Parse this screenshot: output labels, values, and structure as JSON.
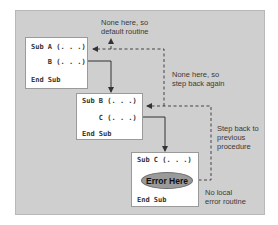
{
  "diagram": {
    "type": "procedure-call-stack error handling flow",
    "colors": {
      "panel_background": "#cfcfcf",
      "box_background": "#ffffff",
      "error_ellipse": "#9a9a9a",
      "line": "#333333"
    },
    "boxes": [
      {
        "id": "sub-a",
        "lines": [
          "Sub A (. . .)",
          "    B (. . .)",
          "End Sub"
        ]
      },
      {
        "id": "sub-b",
        "lines": [
          "Sub B (. . .)",
          "    C (. . .)",
          "End Sub"
        ]
      },
      {
        "id": "sub-c",
        "lines": [
          "Sub C (. . .)",
          "End Sub"
        ],
        "error_label": "Error Here"
      }
    ],
    "annotations": {
      "default_routine": "None here, so\ndefault routine",
      "step_back_again": "None here, so\nstep back again",
      "step_back_previous": "Step back to\nprevious\nprocedure",
      "no_local": "No local\nerror routine"
    },
    "calls": [
      {
        "from": "sub-a",
        "to": "sub-b",
        "style": "solid"
      },
      {
        "from": "sub-b",
        "to": "sub-c",
        "style": "solid"
      }
    ],
    "error_flow": [
      {
        "from": "sub-c",
        "to": "sub-b",
        "style": "dashed"
      },
      {
        "from": "sub-b",
        "to": "sub-a",
        "style": "dashed"
      },
      {
        "from": "sub-a",
        "to": "default-routine",
        "style": "dashed"
      }
    ]
  }
}
